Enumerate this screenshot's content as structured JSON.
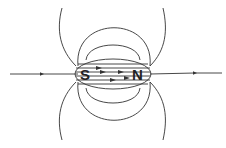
{
  "diagram": {
    "labels": {
      "south_pole": "S",
      "north_pole": "N"
    },
    "colors": {
      "line": "#333333",
      "background": "#ffffff"
    }
  }
}
